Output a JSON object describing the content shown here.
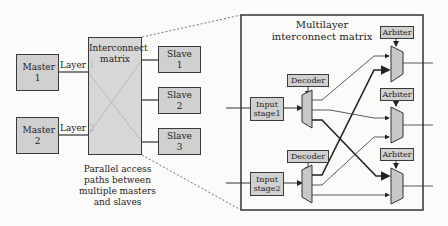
{
  "left_diagram": {
    "masters": [
      {
        "label": "Master 1"
      },
      {
        "label": "Master 2"
      }
    ],
    "layers": [
      "Layer 1",
      "Layer 2"
    ],
    "interconnect": {
      "label": "Interconnect matrix"
    },
    "slaves": [
      {
        "label": "Slave 1"
      },
      {
        "label": "Slave 2"
      },
      {
        "label": "Slave 3"
      }
    ],
    "caption": "Parallel access paths between multiple masters and slaves"
  },
  "right_diagram": {
    "title": "Multilayer interconnect matrix",
    "input_stages": [
      {
        "label": "Input stage1"
      },
      {
        "label": "Input stage2"
      }
    ],
    "decoders": [
      {
        "label": "Decoder"
      },
      {
        "label": "Decoder"
      }
    ],
    "arbiters": [
      {
        "label": "Arbiter"
      },
      {
        "label": "Arbiter"
      },
      {
        "label": "Arbiter"
      }
    ]
  },
  "colors": {
    "box_fill": "#d0d0d0",
    "stroke": "#3a3a3a",
    "background": "#fbfbfa"
  }
}
